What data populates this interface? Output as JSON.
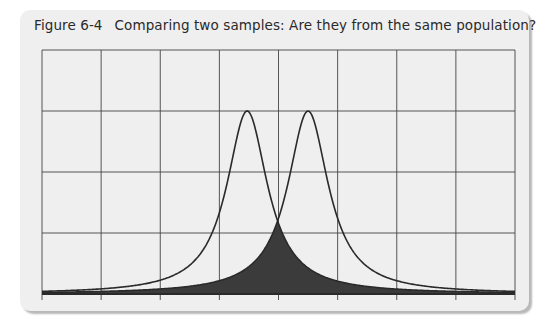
{
  "figure": {
    "number": "Figure 6-4",
    "caption": "Comparing two samples: Are they from the same population?"
  },
  "colors": {
    "card_background": "#efefef",
    "grid": "#444444",
    "curve": "#2a2a2a",
    "overlap_fill": "#3b3b3b"
  },
  "chart_data": {
    "type": "line",
    "title": "Comparing two samples: Are they from the same population?",
    "xlabel": "",
    "ylabel": "",
    "grid": true,
    "x_ticks_visible_labels": false,
    "y_ticks_visible_labels": false,
    "grid_columns": 8,
    "grid_rows": 4,
    "xlim": [
      0,
      8
    ],
    "ylim": [
      0,
      4
    ],
    "series": [
      {
        "name": "Sample A distribution",
        "shape": "bell (heavy-tailed)",
        "peak_x": 3.47,
        "peak_y": 3.0,
        "width": 0.42
      },
      {
        "name": "Sample B distribution",
        "shape": "bell (heavy-tailed)",
        "peak_x": 4.5,
        "peak_y": 3.0,
        "width": 0.42
      }
    ],
    "shaded_region": {
      "label": "overlap of the two distributions",
      "intersection_x": 4.0,
      "intersection_y": 1.28
    },
    "legend": []
  },
  "layout": {
    "plot_left": 42,
    "plot_right": 515,
    "plot_top": 50,
    "plot_bottom": 294,
    "tick_length": 6
  }
}
